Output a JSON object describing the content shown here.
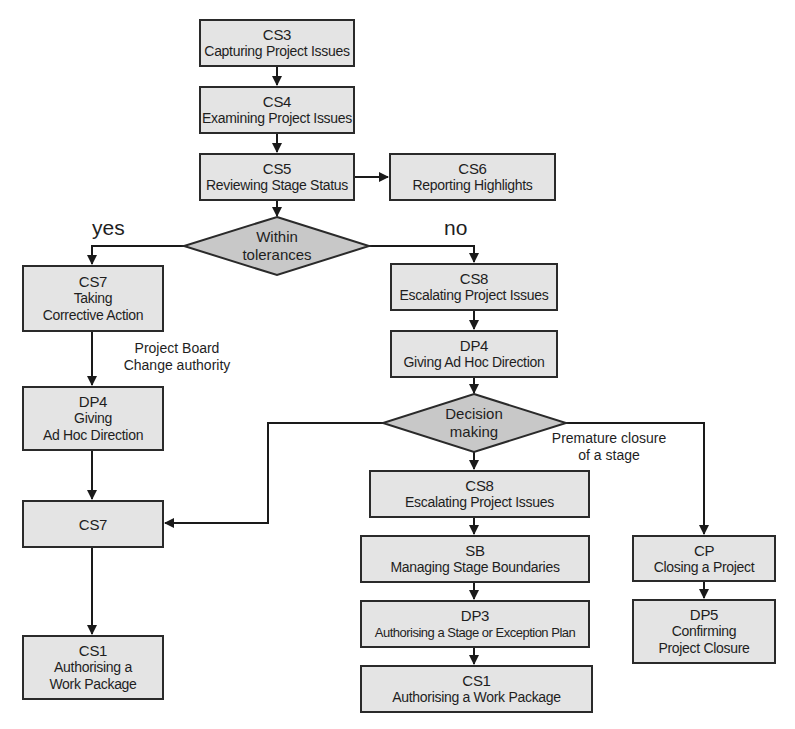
{
  "diagram": {
    "type": "flowchart",
    "colors": {
      "box_fill": "#e4e4e4",
      "decision_fill": "#c8c8c8",
      "stroke": "#2a2a2a"
    },
    "nodes": {
      "cs3": {
        "code": "CS3",
        "lines": [
          "Capturing Project Issues"
        ]
      },
      "cs4": {
        "code": "CS4",
        "lines": [
          "Examining Project Issues"
        ]
      },
      "cs5": {
        "code": "CS5",
        "lines": [
          "Reviewing Stage Status"
        ]
      },
      "cs6": {
        "code": "CS6",
        "lines": [
          "Reporting Highlights"
        ]
      },
      "decision1": {
        "lines": [
          "Within",
          "tolerances"
        ]
      },
      "cs7a": {
        "code": "CS7",
        "lines": [
          "Taking",
          "Corrective Action"
        ]
      },
      "dp4a": {
        "code": "DP4",
        "lines": [
          "Giving",
          "Ad Hoc Direction"
        ]
      },
      "cs7b": {
        "code": "CS7"
      },
      "cs1a": {
        "code": "CS1",
        "lines": [
          "Authorising a",
          "Work Package"
        ]
      },
      "cs8a": {
        "code": "CS8",
        "lines": [
          "Escalating Project Issues"
        ]
      },
      "dp4b": {
        "code": "DP4",
        "lines": [
          "Giving Ad Hoc Direction"
        ]
      },
      "decision2": {
        "lines": [
          "Decision",
          "making"
        ]
      },
      "cs8b": {
        "code": "CS8",
        "lines": [
          "Escalating Project Issues"
        ]
      },
      "sb": {
        "code": "SB",
        "lines": [
          "Managing Stage Boundaries"
        ]
      },
      "dp3": {
        "code": "DP3",
        "lines": [
          "Authorising a Stage or Exception Plan"
        ]
      },
      "cs1b": {
        "code": "CS1",
        "lines": [
          "Authorising a Work Package"
        ]
      },
      "cp": {
        "code": "CP",
        "lines": [
          "Closing a Project"
        ]
      },
      "dp5": {
        "code": "DP5",
        "lines": [
          "Confirming",
          "Project Closure"
        ]
      }
    },
    "labels": {
      "yes": "yes",
      "no": "no",
      "project_board": [
        "Project Board",
        "Change authority"
      ],
      "premature": [
        "Premature closure",
        "of a stage"
      ]
    },
    "edges": [
      [
        "CS3",
        "CS4"
      ],
      [
        "CS4",
        "CS5"
      ],
      [
        "CS5",
        "CS6"
      ],
      [
        "CS5",
        "Within tolerances"
      ],
      [
        "Within tolerances",
        "CS7 Taking Corrective Action",
        "yes"
      ],
      [
        "Within tolerances",
        "CS8 Escalating Project Issues",
        "no"
      ],
      [
        "CS7 Taking Corrective Action",
        "DP4 Giving Ad Hoc Direction",
        "Project Board Change authority"
      ],
      [
        "DP4 Giving Ad Hoc Direction",
        "CS7"
      ],
      [
        "CS7",
        "CS1 Authorising a Work Package"
      ],
      [
        "CS8 Escalating Project Issues",
        "DP4 Giving Ad Hoc Direction"
      ],
      [
        "DP4 Giving Ad Hoc Direction",
        "Decision making"
      ],
      [
        "Decision making",
        "CS7"
      ],
      [
        "Decision making",
        "CS8 Escalating Project Issues"
      ],
      [
        "Decision making",
        "CP Closing a Project",
        "Premature closure of a stage"
      ],
      [
        "CS8 Escalating Project Issues",
        "SB Managing Stage Boundaries"
      ],
      [
        "SB Managing Stage Boundaries",
        "DP3 Authorising a Stage or Exception Plan"
      ],
      [
        "DP3 Authorising a Stage or Exception Plan",
        "CS1 Authorising a Work Package"
      ],
      [
        "CP Closing a Project",
        "DP5 Confirming Project Closure"
      ]
    ]
  }
}
